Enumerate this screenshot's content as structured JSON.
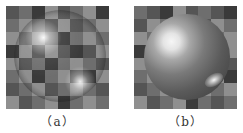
{
  "figure": {
    "panels": [
      {
        "id": "a",
        "caption": "（a）",
        "description": "transparent glass sphere over 8x8 checkerboard",
        "board": [
          [
            2,
            1,
            3,
            0,
            2,
            1,
            0,
            3
          ],
          [
            1,
            0,
            1,
            2,
            0,
            2,
            1,
            0
          ],
          [
            0,
            1,
            0,
            1,
            3,
            1,
            0,
            1
          ],
          [
            3,
            0,
            2,
            0,
            2,
            3,
            2,
            0
          ],
          [
            0,
            2,
            1,
            3,
            1,
            0,
            1,
            2
          ],
          [
            1,
            0,
            3,
            1,
            0,
            2,
            3,
            0
          ],
          [
            2,
            1,
            0,
            2,
            1,
            0,
            1,
            2
          ],
          [
            0,
            2,
            1,
            0,
            3,
            1,
            0,
            1
          ]
        ]
      },
      {
        "id": "b",
        "caption": "（b）",
        "description": "diffuse/smooth shaded sphere over 8x8 checkerboard",
        "board": [
          [
            1,
            2,
            3,
            0,
            2,
            1,
            2,
            3
          ],
          [
            2,
            0,
            1,
            2,
            0,
            2,
            0,
            1
          ],
          [
            0,
            1,
            0,
            1,
            2,
            1,
            1,
            0
          ],
          [
            3,
            0,
            2,
            0,
            1,
            0,
            2,
            0
          ],
          [
            0,
            2,
            1,
            2,
            1,
            0,
            1,
            2
          ],
          [
            1,
            0,
            2,
            1,
            0,
            1,
            0,
            3
          ],
          [
            2,
            1,
            0,
            2,
            1,
            0,
            1,
            0
          ],
          [
            0,
            2,
            1,
            0,
            3,
            1,
            2,
            1
          ]
        ]
      }
    ],
    "tile_colors": [
      "#8f8f8f",
      "#6e6e6e",
      "#555555",
      "#3a3a3a"
    ]
  }
}
